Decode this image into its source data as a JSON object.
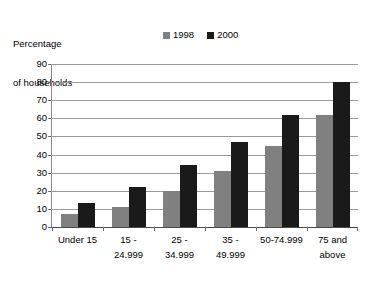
{
  "chart_data": {
    "type": "bar",
    "title": "Percentage of households",
    "title_lines": [
      "Percentage",
      "of households"
    ],
    "xlabel": "",
    "ylabel": "Percentage of households",
    "categories": [
      "Under 15",
      "15 - 24.999",
      "25 - 34.999",
      "35 - 49.999",
      "50-74.999",
      "75 and above"
    ],
    "category_lines": [
      [
        "Under 15",
        ""
      ],
      [
        "15 -",
        "24.999"
      ],
      [
        "25 -",
        "34.999"
      ],
      [
        "35 -",
        "49.999"
      ],
      [
        "50-74.999",
        ""
      ],
      [
        "75 and",
        "above"
      ]
    ],
    "series": [
      {
        "name": "1998",
        "color": "#808080",
        "values": [
          7,
          11,
          20,
          31,
          45,
          62
        ]
      },
      {
        "name": "2000",
        "color": "#1a1a1a",
        "values": [
          13,
          22,
          34,
          47,
          62,
          80
        ]
      }
    ],
    "ylim": [
      0,
      90
    ],
    "ytick_step": 10,
    "yticks": [
      "0",
      "10",
      "20",
      "30",
      "40",
      "50",
      "60",
      "70",
      "80",
      "90"
    ],
    "grid": true,
    "legend_position": "top-center"
  },
  "legend": {
    "items": [
      {
        "label": "1998",
        "color": "#808080"
      },
      {
        "label": "2000",
        "color": "#1a1a1a"
      }
    ]
  },
  "colors": {
    "series_1998": "#808080",
    "series_2000": "#1a1a1a",
    "gridline": "#9a9a9a",
    "axis": "#4a4a4a",
    "background": "#ffffff"
  }
}
